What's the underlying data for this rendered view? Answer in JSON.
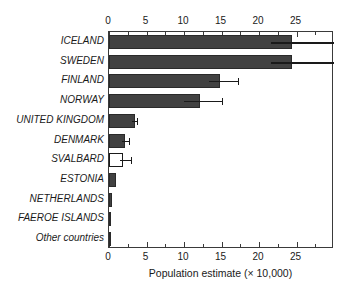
{
  "chart_data": {
    "type": "bar",
    "orientation": "horizontal",
    "title": "",
    "xlabel": "Population estimate (× 10,000)",
    "ylabel": "",
    "xlim": [
      0,
      30
    ],
    "xticks": [
      0,
      5,
      10,
      15,
      20,
      25
    ],
    "xtick_labels": [
      "0",
      "5",
      "10",
      "15",
      "20",
      "25"
    ],
    "minor_tick_interval": 2.5,
    "grid": false,
    "legend": null,
    "axis_top_labels": [
      "0",
      "5",
      "10",
      "15",
      "20",
      "25"
    ],
    "axis_bottom_labels": [
      "0",
      "5",
      "10",
      "15",
      "20",
      "25"
    ],
    "categories": [
      "ICELAND",
      "SWEDEN",
      "FINLAND",
      "NORWAY",
      "UNITED KINGDOM",
      "DENMARK",
      "SVALBARD",
      "ESTONIA",
      "NETHERLANDS",
      "FAEROE ISLANDS",
      "Other countries"
    ],
    "values": [
      24.4,
      24.4,
      14.8,
      12.1,
      3.4,
      2.1,
      1.9,
      0.9,
      0.35,
      0.3,
      0.15
    ],
    "error_low": [
      21.6,
      21.6,
      13.3,
      10.0,
      3.1,
      1.7,
      1.5,
      null,
      null,
      null,
      null
    ],
    "error_high": [
      30.0,
      30.0,
      17.2,
      15.0,
      3.7,
      2.6,
      2.9,
      null,
      null,
      null,
      null
    ],
    "bar_styles": [
      "filled",
      "filled",
      "filled",
      "filled",
      "filled",
      "filled",
      "hollow",
      "filled",
      "filled",
      "filled",
      "filled"
    ],
    "colors": {
      "bar_fill": "#414141",
      "bar_hollow_fill": "#ffffff",
      "bar_edge": "#2a2a2a",
      "error_bar": "#1a1a1a",
      "axis": "#3a3a3a",
      "text": "#1a1a1a",
      "background": "#ffffff"
    }
  }
}
